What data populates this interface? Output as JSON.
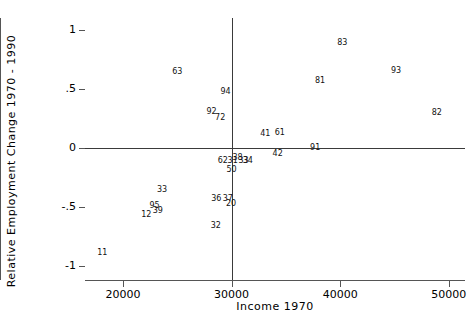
{
  "chart_data": {
    "type": "scatter",
    "title": "",
    "xlabel": "Income 1970",
    "ylabel": "Relative Employment Change 1970 - 1990",
    "xlim": [
      16500,
      51500
    ],
    "ylim": [
      -1.12,
      1.1
    ],
    "xticks": [
      20000,
      30000,
      40000,
      50000
    ],
    "xticklabels": [
      "20000",
      "30000",
      "40000",
      "50000"
    ],
    "yticks": [
      1,
      0.5,
      0,
      -0.5,
      -1
    ],
    "yticklabels": [
      "1",
      ".5",
      "0",
      "-.5",
      "-1"
    ],
    "grid": false,
    "legend": null,
    "marker_style": "text-label",
    "reference_lines": [
      {
        "orientation": "horizontal",
        "value": 0
      },
      {
        "orientation": "vertical",
        "value": 30000
      }
    ],
    "points": [
      {
        "label": "63",
        "x": 25000,
        "y": 0.645
      },
      {
        "label": "94",
        "x": 29450,
        "y": 0.475
      },
      {
        "label": "92",
        "x": 28150,
        "y": 0.305
      },
      {
        "label": "72",
        "x": 28950,
        "y": 0.255
      },
      {
        "label": "83",
        "x": 40200,
        "y": 0.885
      },
      {
        "label": "93",
        "x": 45150,
        "y": 0.655
      },
      {
        "label": "81",
        "x": 38150,
        "y": 0.565
      },
      {
        "label": "82",
        "x": 48900,
        "y": 0.295
      },
      {
        "label": "41",
        "x": 33100,
        "y": 0.115
      },
      {
        "label": "61",
        "x": 34450,
        "y": 0.125
      },
      {
        "label": "91",
        "x": 37700,
        "y": 0.0
      },
      {
        "label": "42",
        "x": 34250,
        "y": -0.055
      },
      {
        "label": "62",
        "x": 29200,
        "y": -0.115
      },
      {
        "label": "31",
        "x": 30100,
        "y": -0.115
      },
      {
        "label": "38",
        "x": 30550,
        "y": -0.085
      },
      {
        "label": "33",
        "x": 31100,
        "y": -0.115
      },
      {
        "label": "34",
        "x": 31500,
        "y": -0.115
      },
      {
        "label": "50",
        "x": 30000,
        "y": -0.185
      },
      {
        "label": "33",
        "x": 23600,
        "y": -0.355
      },
      {
        "label": "36",
        "x": 28600,
        "y": -0.435
      },
      {
        "label": "37",
        "x": 29650,
        "y": -0.435
      },
      {
        "label": "20",
        "x": 29950,
        "y": -0.475
      },
      {
        "label": "95",
        "x": 22900,
        "y": -0.495
      },
      {
        "label": "39",
        "x": 23200,
        "y": -0.535
      },
      {
        "label": "12",
        "x": 22150,
        "y": -0.565
      },
      {
        "label": "32",
        "x": 28550,
        "y": -0.665
      },
      {
        "label": "11",
        "x": 18100,
        "y": -0.895
      }
    ]
  },
  "axes": {
    "ylabel_text": "Relative Employment Change 1970 - 1990",
    "xlabel_text": "Income 1970"
  }
}
